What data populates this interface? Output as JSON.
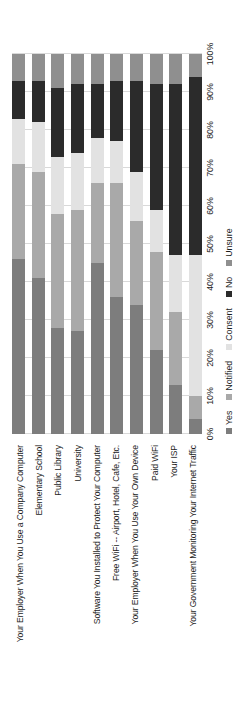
{
  "chart_data": {
    "type": "bar",
    "orientation": "horizontal-stacked",
    "title": "",
    "xlabel": "",
    "ylabel": "",
    "xlim": [
      0,
      100
    ],
    "grid": true,
    "legend_position": "bottom",
    "xticks": [
      "0%",
      "10%",
      "20%",
      "30%",
      "40%",
      "50%",
      "60%",
      "70%",
      "80%",
      "90%",
      "100%"
    ],
    "xtick_values": [
      0,
      10,
      20,
      30,
      40,
      50,
      60,
      70,
      80,
      90,
      100
    ],
    "legend": [
      "Yes",
      "Notified",
      "Consent",
      "No",
      "Unsure"
    ],
    "colors": {
      "Yes": "#7d7d7d",
      "Notified": "#a9a9a9",
      "Consent": "#e2e2e2",
      "No": "#2b2b2b",
      "Unsure": "#8f8f8f"
    },
    "categories": [
      "Your Employer When You Use a Company Computer",
      "Elementary School",
      "Public Library",
      "University",
      "Software You Installed to Protect Your Computer",
      "Free WiFi -- Airport, Hotel, Cafe, Etc.",
      "Your Employer When You Use Your Own Device",
      "Paid WiFi",
      "Your ISP",
      "Your Government Monitoring Your Internet Traffic"
    ],
    "series": [
      {
        "name": "Yes",
        "values": [
          46,
          41,
          28,
          27,
          45,
          36,
          34,
          22,
          13,
          4
        ]
      },
      {
        "name": "Notified",
        "values": [
          25,
          28,
          30,
          32,
          21,
          30,
          22,
          26,
          19,
          6
        ]
      },
      {
        "name": "Consent",
        "values": [
          12,
          13,
          15,
          15,
          12,
          11,
          13,
          11,
          15,
          37
        ]
      },
      {
        "name": "No",
        "values": [
          10,
          11,
          18,
          18,
          14,
          16,
          24,
          33,
          45,
          47
        ]
      },
      {
        "name": "Unsure",
        "values": [
          7,
          7,
          9,
          8,
          8,
          7,
          7,
          8,
          8,
          6
        ]
      }
    ],
    "rows": [
      {
        "label": "Your Employer When You Use a Company Computer",
        "Yes": 46,
        "Notified": 25,
        "Consent": 12,
        "No": 10,
        "Unsure": 7
      },
      {
        "label": "Elementary School",
        "Yes": 41,
        "Notified": 28,
        "Consent": 13,
        "No": 11,
        "Unsure": 7
      },
      {
        "label": "Public Library",
        "Yes": 28,
        "Notified": 30,
        "Consent": 15,
        "No": 18,
        "Unsure": 9
      },
      {
        "label": "University",
        "Yes": 27,
        "Notified": 32,
        "Consent": 15,
        "No": 18,
        "Unsure": 8
      },
      {
        "label": "Software You Installed to Protect Your Computer",
        "Yes": 45,
        "Notified": 21,
        "Consent": 12,
        "No": 14,
        "Unsure": 8
      },
      {
        "label": "Free WiFi -- Airport, Hotel, Cafe, Etc.",
        "Yes": 36,
        "Notified": 30,
        "Consent": 11,
        "No": 16,
        "Unsure": 7
      },
      {
        "label": "Your Employer When You Use Your Own Device",
        "Yes": 34,
        "Notified": 22,
        "Consent": 13,
        "No": 24,
        "Unsure": 7
      },
      {
        "label": "Paid WiFi",
        "Yes": 22,
        "Notified": 26,
        "Consent": 11,
        "No": 33,
        "Unsure": 8
      },
      {
        "label": "Your ISP",
        "Yes": 13,
        "Notified": 19,
        "Consent": 15,
        "No": 45,
        "Unsure": 8
      },
      {
        "label": "Your Government Monitoring Your Internet Traffic",
        "Yes": 4,
        "Notified": 6,
        "Consent": 37,
        "No": 47,
        "Unsure": 6
      }
    ]
  }
}
